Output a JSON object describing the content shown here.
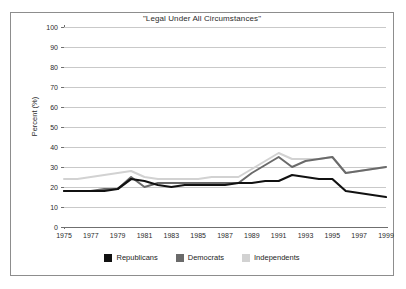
{
  "chart_data": {
    "type": "line",
    "title": "\"Legal Under All Circumstances\"",
    "xlabel": "",
    "ylabel": "Percent (%)",
    "ylim": [
      0,
      100
    ],
    "ytick_step": 10,
    "yticks": [
      "0",
      "10",
      "20",
      "30",
      "40",
      "50",
      "60",
      "70",
      "80",
      "90",
      "100"
    ],
    "grid": true,
    "legend_position": "bottom",
    "x": [
      1975,
      1976,
      1977,
      1978,
      1979,
      1980,
      1981,
      1982,
      1983,
      1984,
      1985,
      1986,
      1987,
      1988,
      1989,
      1990,
      1991,
      1992,
      1993,
      1994,
      1995,
      1996,
      1997,
      1998,
      1999
    ],
    "xtick_labels": [
      "1975",
      "1977",
      "1979",
      "1981",
      "1983",
      "1985",
      "1987",
      "1989",
      "1991",
      "1993",
      "1995",
      "1997",
      "1999"
    ],
    "xtick_values": [
      1975,
      1977,
      1979,
      1981,
      1983,
      1985,
      1987,
      1989,
      1991,
      1993,
      1995,
      1997,
      1999
    ],
    "series": [
      {
        "name": "Republicans",
        "color": "#111111",
        "values": [
          18,
          18,
          18,
          18,
          19,
          24,
          23,
          21,
          20,
          21,
          21,
          21,
          21,
          22,
          22,
          23,
          23,
          26,
          25,
          24,
          24,
          18,
          17,
          16,
          15
        ]
      },
      {
        "name": "Democrats",
        "color": "#6a6a6a",
        "values": [
          18,
          18,
          18,
          19,
          19,
          25,
          20,
          22,
          22,
          22,
          22,
          22,
          22,
          22,
          27,
          31,
          35,
          30,
          33,
          34,
          35,
          27,
          28,
          29,
          30
        ]
      },
      {
        "name": "Independents",
        "color": "#d2d2d2",
        "values": [
          24,
          24,
          25,
          26,
          27,
          28,
          25,
          24,
          24,
          24,
          24,
          25,
          25,
          25,
          29,
          33,
          37,
          34,
          34,
          34,
          35,
          27,
          28,
          29,
          30
        ]
      }
    ]
  },
  "legend": {
    "items": [
      {
        "label": "Republicans",
        "color": "#111111"
      },
      {
        "label": "Democrats",
        "color": "#6a6a6a"
      },
      {
        "label": "Independents",
        "color": "#d2d2d2"
      }
    ]
  }
}
